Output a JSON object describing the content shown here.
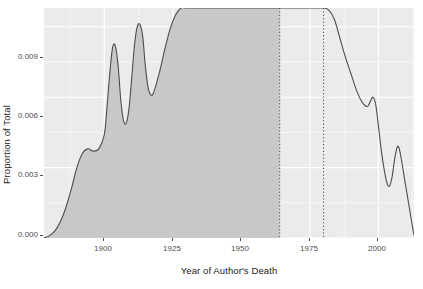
{
  "chart_data": {
    "type": "area",
    "title": "",
    "xlabel": "Year of Author's Death",
    "ylabel": "Proportion of Total",
    "xlim": [
      1878,
      2013
    ],
    "ylim": [
      0.0,
      0.0098
    ],
    "x_ticks": [
      1900,
      1925,
      1950,
      1975,
      2000
    ],
    "x_tick_labels": [
      "1900",
      "1925",
      "1950",
      "1975",
      "2000"
    ],
    "y_ticks": [
      0.0,
      0.003,
      0.006,
      0.009
    ],
    "y_tick_labels": [
      "0.000",
      "0.003",
      "0.006",
      "0.009"
    ],
    "grid": true,
    "grid_color": "#ffffff",
    "panel_color": "#ebebeb",
    "line_color": "#4d4d4d",
    "fill_color": "#c8c8c8",
    "legend": null,
    "annotations": [
      {
        "type": "vline",
        "name": "public-domain-cutoff-line",
        "x": 1964,
        "style": "dotted",
        "color": "#4d4d4d"
      },
      {
        "type": "vline",
        "name": "copyright-term-line",
        "x": 1980,
        "style": "dotted",
        "color": "#4d4d4d"
      }
    ],
    "shaded_region": {
      "x_start": 1878,
      "x_end": 1964
    },
    "series": [
      {
        "name": "Proportion of Total",
        "x": [
          1878,
          1880,
          1882,
          1884,
          1886,
          1888,
          1890,
          1892,
          1894,
          1896,
          1898,
          1900,
          1901,
          1902,
          1903,
          1904,
          1905,
          1906,
          1907,
          1908,
          1909,
          1910,
          1911,
          1912,
          1913,
          1914,
          1915,
          1916,
          1917,
          1918,
          1920,
          1922,
          1924,
          1926,
          1928,
          1930,
          1935,
          1940,
          1945,
          1950,
          1955,
          1960,
          1964,
          1968,
          1972,
          1976,
          1980,
          1982,
          1984,
          1986,
          1988,
          1990,
          1992,
          1994,
          1996,
          1997,
          1998,
          1999,
          2000,
          2001,
          2002,
          2003,
          2004,
          2005,
          2006,
          2007,
          2008,
          2010,
          2012,
          2013
        ],
        "values": [
          0.0,
          0.0001,
          0.0003,
          0.0007,
          0.0013,
          0.0021,
          0.003,
          0.0036,
          0.0038,
          0.0037,
          0.0038,
          0.0044,
          0.0056,
          0.007,
          0.0081,
          0.0082,
          0.0074,
          0.0059,
          0.005,
          0.0049,
          0.0055,
          0.0068,
          0.0082,
          0.009,
          0.0091,
          0.0086,
          0.0073,
          0.0064,
          0.0061,
          0.0062,
          0.007,
          0.008,
          0.0089,
          0.0095,
          0.0098,
          0.0098,
          0.0098,
          0.0098,
          0.0098,
          0.0098,
          0.0098,
          0.0098,
          0.0098,
          0.0098,
          0.0098,
          0.0098,
          0.0098,
          0.0097,
          0.0093,
          0.0085,
          0.0077,
          0.007,
          0.0063,
          0.0058,
          0.0056,
          0.0058,
          0.006,
          0.0057,
          0.0048,
          0.0038,
          0.003,
          0.0024,
          0.0022,
          0.0026,
          0.0034,
          0.0039,
          0.0036,
          0.0022,
          0.0008,
          0.0001
        ]
      }
    ]
  },
  "axes": {
    "y_title": "Proportion of Total",
    "x_title": "Year of Author's Death",
    "y_tick_labels": [
      "0.009",
      "0.006",
      "0.003",
      "0.000"
    ],
    "x_tick_labels": [
      "1900",
      "1925",
      "1950",
      "1975",
      "2000"
    ]
  }
}
